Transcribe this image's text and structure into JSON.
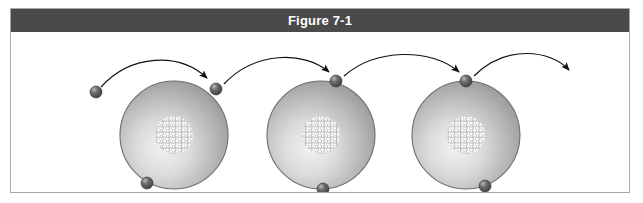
{
  "figure": {
    "title": "Figure 7-1",
    "title_bar_color": "#4a4a4a",
    "title_text_color": "#ffffff",
    "frame_border_color": "#a8a8a8",
    "background_color": "#ffffff"
  },
  "diagram": {
    "type": "electron-flow-conduction",
    "atom_fill_light": "#e8e8e8",
    "atom_fill_mid": "#b4b4b4",
    "atom_fill_dark": "#8a8a8a",
    "atom_outline_color": "#6e6e6e",
    "electron_color": "#4f4f4f",
    "electron_highlight_color": "#d6d6d6",
    "nucleus_outline_color": "#6a6a6a",
    "nucleus_fill_color": "#ffffff",
    "arrow_color": "#1a1a1a",
    "atoms": [
      {
        "id": "atom-1",
        "label": "atom-1",
        "cx": 163,
        "cy": 103,
        "r": 54,
        "nucleus_r": 19
      },
      {
        "id": "atom-2",
        "label": "atom-2",
        "cx": 310,
        "cy": 103,
        "r": 54,
        "nucleus_r": 19
      },
      {
        "id": "atom-3",
        "label": "atom-3",
        "cx": 455,
        "cy": 103,
        "r": 54,
        "nucleus_r": 19
      }
    ],
    "electrons": [
      {
        "id": "free-electron",
        "label": "free-electron-incoming",
        "cx": 85,
        "cy": 60,
        "r": 6
      },
      {
        "id": "electron-top-1",
        "label": "electron-on-atom-1-top",
        "cx": 205,
        "cy": 57,
        "r": 6
      },
      {
        "id": "electron-top-2",
        "label": "electron-on-atom-2-top",
        "cx": 325,
        "cy": 49,
        "r": 6
      },
      {
        "id": "electron-top-3",
        "label": "electron-on-atom-3-top",
        "cx": 455,
        "cy": 49,
        "r": 6
      },
      {
        "id": "electron-bottom-1",
        "label": "electron-on-atom-1-bottom",
        "cx": 136,
        "cy": 151,
        "r": 6
      },
      {
        "id": "electron-bottom-2",
        "label": "electron-on-atom-2-bottom",
        "cx": 312,
        "cy": 157,
        "r": 6
      },
      {
        "id": "electron-bottom-3",
        "label": "electron-on-atom-3-bottom",
        "cx": 474,
        "cy": 154,
        "r": 6
      }
    ],
    "arrows": [
      {
        "id": "arrow-1",
        "label": "arrow-free-to-atom-1",
        "path": "M 90 55 C 120 22 168 20 198 48"
      },
      {
        "id": "arrow-2",
        "label": "arrow-atom-1-to-atom-2",
        "path": "M 213 52 C 243 20 292 18 320 42"
      },
      {
        "id": "arrow-3",
        "label": "arrow-atom-2-to-atom-3",
        "path": "M 333 44 C 365 16 420 16 450 42"
      },
      {
        "id": "arrow-4",
        "label": "arrow-atom-3-outgoing",
        "path": "M 463 44 C 495 12 540 18 560 40"
      }
    ]
  }
}
